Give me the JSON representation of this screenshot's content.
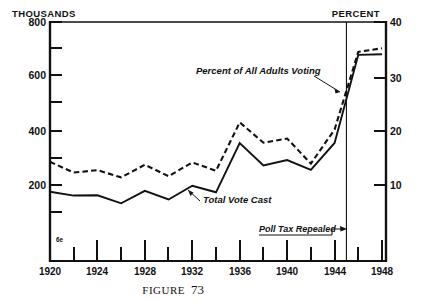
{
  "figure": {
    "caption_word": "FIGURE",
    "caption_number": "73",
    "origin_marker": "6e"
  },
  "axes": {
    "left_unit": "THOUSANDS",
    "right_unit": "PERCENT",
    "left_labels": [
      "800",
      "600",
      "400",
      "200"
    ],
    "right_labels": [
      "40",
      "30",
      "20",
      "10"
    ],
    "x_labels": [
      "1920",
      "1924",
      "1928",
      "1932",
      "1936",
      "1940",
      "1944",
      "1948"
    ]
  },
  "annotations": {
    "dashed_series": "Percent of All Adults Voting",
    "solid_series": "Total  Vote Cast",
    "event": "Poll Tax Repealed"
  },
  "colors": {
    "ink": "#111111",
    "background": "#ffffff"
  },
  "chart_data": {
    "type": "line",
    "title": "",
    "subtitle": "",
    "xlabel": "",
    "ylabel": "THOUSANDS",
    "y2label": "PERCENT",
    "xlim": [
      1919,
      1949.5
    ],
    "ylim": [
      0,
      800
    ],
    "y2lim": [
      0,
      40
    ],
    "yticks": [
      0,
      100,
      200,
      300,
      400,
      500,
      600,
      700,
      800
    ],
    "ytick_labels": [
      "",
      "",
      "200",
      "",
      "400",
      "",
      "600",
      "",
      "800"
    ],
    "y2ticks": [
      0,
      10,
      20,
      30,
      40
    ],
    "y2tick_labels": [
      "",
      "10",
      "20",
      "30",
      "40"
    ],
    "xticks": [
      1920,
      1922,
      1924,
      1926,
      1928,
      1930,
      1932,
      1934,
      1936,
      1938,
      1940,
      1942,
      1944,
      1946,
      1948
    ],
    "xtick_labels": [
      "1920",
      "",
      "1924",
      "",
      "1928",
      "",
      "1932",
      "",
      "1936",
      "",
      "1940",
      "",
      "1944",
      "",
      "1948"
    ],
    "grid": false,
    "legend": "inline-annotations",
    "x": [
      1920,
      1922,
      1924,
      1926,
      1928,
      1930,
      1932,
      1934,
      1936,
      1938,
      1940,
      1942,
      1944,
      1946,
      1948
    ],
    "series": [
      {
        "name": "Percent of All Adults Voting",
        "style": "dashed",
        "axis": "right",
        "units": "percent",
        "values": [
          16.6,
          14.8,
          15.2,
          14.0,
          16.1,
          14.2,
          16.5,
          15.1,
          23.2,
          19.8,
          20.5,
          16.3,
          22.0,
          35.0,
          35.6
        ]
      },
      {
        "name": "Total Vote Cast",
        "style": "solid",
        "axis": "left",
        "units": "thousands",
        "values": [
          232,
          219,
          220,
          193,
          235,
          206,
          252,
          230,
          395,
          320,
          338,
          305,
          395,
          690,
          692
        ]
      }
    ],
    "event_lines": [
      {
        "label": "Poll Tax Repealed",
        "x": 1945
      }
    ]
  }
}
